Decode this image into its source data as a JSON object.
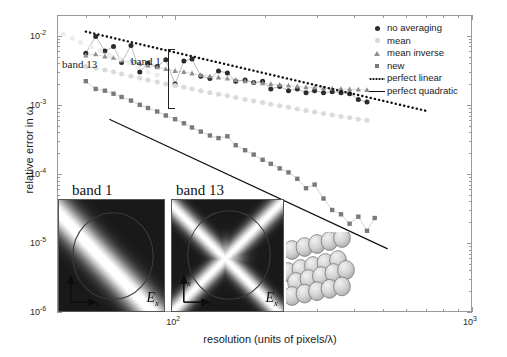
{
  "figure": {
    "domain": "chart",
    "background": "#ffffff"
  },
  "axes": {
    "ylabel": "relative error in ω",
    "xlabel_prefix": "resolution (units of pixels/",
    "xlabel_lambda": "λ",
    "xlabel_suffix": ")",
    "xlabel": "resolution (units of pixels/λ)",
    "x_ticks": [
      {
        "value": 100,
        "label_base": "10",
        "label_exp": "2",
        "px": 242
      },
      {
        "value": 1000,
        "label_base": "10",
        "label_exp": "3",
        "px": 472
      }
    ],
    "y_ticks": [
      {
        "value": 0.01,
        "label_base": "10",
        "label_exp": "-2",
        "px": 72
      },
      {
        "value": 0.001,
        "label_base": "10",
        "label_exp": "-3",
        "px": 120
      },
      {
        "value": 0.0001,
        "label_base": "10",
        "label_exp": "-4",
        "px": 168
      },
      {
        "value": 1e-05,
        "label_base": "10",
        "label_exp": "-5",
        "px": 216
      },
      {
        "value": 1e-06,
        "label_base": "10",
        "label_exp": "-6",
        "px": 312
      }
    ]
  },
  "legend": {
    "position": "top-right",
    "entries": [
      {
        "label": "no averaging",
        "marker": "circle",
        "color": "#2b2b2b"
      },
      {
        "label": "mean",
        "marker": "circle",
        "color": "#d8d8d8"
      },
      {
        "label": "mean inverse",
        "marker": "triangle",
        "color": "#8e8e8e"
      },
      {
        "label": "new",
        "marker": "square",
        "color": "#7a7a7a"
      },
      {
        "label": "perfect linear",
        "marker": "dotted-line",
        "color": "#111111"
      },
      {
        "label": "perfect quadratic",
        "marker": "solid-line",
        "color": "#111111"
      }
    ]
  },
  "annotations": [
    {
      "id": "band-13-label",
      "text": "band 13",
      "x": 62,
      "y": 58
    },
    {
      "id": "band-1-label",
      "text": "band 1",
      "x": 131,
      "y": 55
    }
  ],
  "insets": [
    {
      "id": "inset-band-1",
      "title": "band 1",
      "field_label": "E",
      "field_sub": "x",
      "axis_x": "x",
      "axis_y": "y",
      "pattern": "diagonal-stripe"
    },
    {
      "id": "inset-band-13",
      "title": "band 13",
      "field_label": "E",
      "field_sub": "x",
      "axis_x": "x",
      "axis_y": "y",
      "pattern": "x-cross"
    }
  ],
  "sphere_cluster": {
    "id": "fcc-sphere-lattice",
    "sphere_count": 20,
    "fill": "#cfcfcf",
    "stroke": "#6d6d6d"
  },
  "chart_data": {
    "type": "scatter",
    "title": "",
    "xlabel": "resolution (units of pixels/λ)",
    "ylabel": "relative error in ω",
    "xscale": "log",
    "yscale": "log",
    "xlim": [
      40,
      1000
    ],
    "ylim": [
      1e-06,
      0.02
    ],
    "grid": false,
    "legend_position": "top-right",
    "series": [
      {
        "name": "no averaging",
        "marker": "circle",
        "color": "#2b2b2b",
        "band": 1,
        "x": [
          50,
          54,
          58,
          62,
          66,
          71,
          76,
          81,
          87,
          93,
          100,
          107,
          114,
          122,
          131,
          140,
          150,
          160,
          172,
          184,
          197,
          210,
          225,
          241,
          258,
          276,
          295,
          316,
          338,
          362,
          387,
          414,
          443
        ],
        "y": [
          0.0056,
          0.0098,
          0.006,
          0.007,
          0.0041,
          0.0072,
          0.003,
          0.004,
          0.0036,
          0.0045,
          0.002,
          0.0043,
          0.0046,
          0.0026,
          0.0024,
          0.0031,
          0.0029,
          0.0022,
          0.0023,
          0.0021,
          0.0022,
          0.0017,
          0.00185,
          0.0016,
          0.0017,
          0.0015,
          0.0016,
          0.0015,
          0.00155,
          0.0015,
          0.00145,
          0.0012,
          0.0011
        ]
      },
      {
        "name": "mean",
        "marker": "circle",
        "color": "#dadada",
        "band": 1,
        "x": [
          50,
          54,
          58,
          62,
          66,
          71,
          76,
          81,
          87,
          93,
          100,
          107,
          114,
          122,
          131,
          140,
          150,
          160,
          172,
          184,
          197,
          210,
          225,
          241,
          258,
          276,
          295,
          316,
          338,
          362,
          387,
          414,
          443
        ],
        "y": [
          0.0036,
          0.0034,
          0.0032,
          0.003,
          0.0028,
          0.0026,
          0.00245,
          0.0023,
          0.00215,
          0.002,
          0.0019,
          0.0018,
          0.0017,
          0.0016,
          0.0015,
          0.00142,
          0.00135,
          0.00128,
          0.0012,
          0.00114,
          0.00108,
          0.00102,
          0.00097,
          0.00092,
          0.00087,
          0.00083,
          0.00079,
          0.00075,
          0.00071,
          0.00068,
          0.00065,
          0.00062,
          0.0006
        ]
      },
      {
        "name": "mean inverse",
        "marker": "triangle",
        "color": "#8e8e8e",
        "band": 1,
        "x": [
          50,
          54,
          58,
          62,
          66,
          71,
          76,
          81,
          87,
          93,
          100,
          107,
          114,
          122,
          131,
          140,
          150,
          160,
          172,
          184,
          197,
          210,
          225,
          241,
          258,
          276,
          295,
          316,
          338,
          362,
          387,
          414,
          443
        ],
        "y": [
          0.0052,
          0.0054,
          0.005,
          0.0048,
          0.0044,
          0.0042,
          0.0039,
          0.0037,
          0.0035,
          0.0033,
          0.0031,
          0.003,
          0.00285,
          0.0027,
          0.0026,
          0.0025,
          0.0024,
          0.0023,
          0.0022,
          0.0021,
          0.00205,
          0.002,
          0.00195,
          0.0019,
          0.00185,
          0.0018,
          0.00178,
          0.00175,
          0.00172,
          0.0017,
          0.00168,
          0.00166,
          0.00164
        ]
      },
      {
        "name": "new",
        "marker": "square",
        "color": "#7a7a7a",
        "band": 1,
        "x": [
          50,
          54,
          58,
          62,
          66,
          71,
          76,
          81,
          87,
          93,
          100,
          107,
          114,
          122,
          131,
          140,
          150,
          160,
          172,
          184,
          197,
          210,
          225,
          241,
          258,
          276,
          295,
          316,
          338,
          362,
          387,
          414,
          443,
          470
        ],
        "y": [
          0.0022,
          0.0017,
          0.0016,
          0.00145,
          0.0013,
          0.00115,
          0.001,
          0.0009,
          0.0008,
          0.0007,
          0.00062,
          0.00054,
          0.00047,
          0.00041,
          0.00036,
          0.00033,
          0.00035,
          0.00026,
          0.00022,
          0.00019,
          0.00016,
          0.00014,
          0.00012,
          0.000105,
          8.5e-05,
          6.2e-05,
          7e-05,
          4.4e-05,
          3e-05,
          2.6e-05,
          1.9e-05,
          2.4e-05,
          1.5e-05,
          2.3e-05
        ]
      },
      {
        "name": "band 13 faded",
        "marker": "circle",
        "color": "#ededed",
        "band": 13,
        "x": [
          42,
          45,
          48,
          52,
          56,
          60,
          65,
          70,
          75,
          81,
          87
        ],
        "y": [
          0.0105,
          0.0092,
          0.008,
          0.007,
          0.0061,
          0.0053,
          0.0046,
          0.004,
          0.0035,
          0.003,
          0.0027
        ]
      }
    ],
    "reference_lines": [
      {
        "name": "perfect linear",
        "style": "dotted",
        "slope": -1,
        "x0": 50,
        "y0": 0.0115,
        "x1": 700,
        "y1": 0.00082
      },
      {
        "name": "perfect quadratic",
        "style": "solid",
        "slope": -2,
        "x0": 60,
        "y0": 0.00062,
        "x1": 520,
        "y1": 8.2e-06
      }
    ]
  }
}
